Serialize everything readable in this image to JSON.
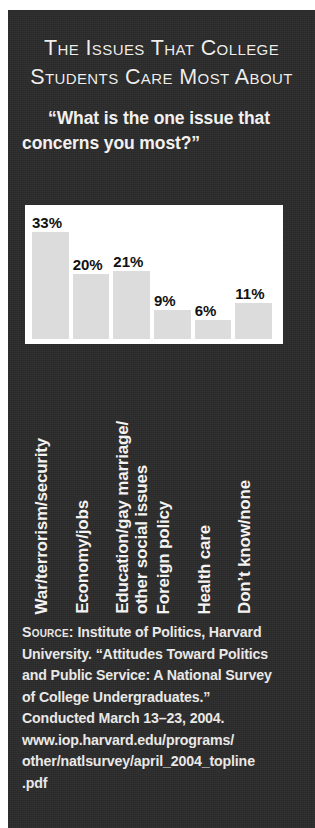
{
  "panel": {
    "background_color": "#2c2b2b",
    "text_color": "#f2f1ef"
  },
  "title": {
    "line1": "The Issues That College",
    "line2": "Students Care Most About"
  },
  "subtitle": {
    "text": "“What is the one issue that concerns you most?”"
  },
  "chart_data": {
    "type": "bar",
    "title": "The Issues That College Students Care Most About",
    "subtitle": "“What is the one issue that concerns you most?”",
    "xlabel": "",
    "ylabel": "",
    "ylim": [
      0,
      40
    ],
    "grid": false,
    "legend": "none",
    "bar_color": "#dcdcdc",
    "plot_background": "#ffffff",
    "value_suffix": "%",
    "categories": [
      "War/terrorism/security",
      "Economy/jobs",
      "Education/gay marriage/ other social issues",
      "Foreign policy",
      "Health care",
      "Don’t know/none"
    ],
    "values": [
      33,
      20,
      21,
      9,
      6,
      11
    ],
    "data_labels": [
      "33%",
      "20%",
      "21%",
      "9%",
      "6%",
      "11%"
    ]
  },
  "category_labels": [
    {
      "lines": [
        "War/terrorism/security"
      ]
    },
    {
      "lines": [
        "Economy/jobs"
      ]
    },
    {
      "lines": [
        "Education/gay marriage/",
        "other social issues"
      ]
    },
    {
      "lines": [
        "Foreign policy"
      ]
    },
    {
      "lines": [
        "Health care"
      ]
    },
    {
      "lines": [
        "Don’t know/none"
      ]
    }
  ],
  "source": {
    "label": "Source:",
    "line1": " Institute of Politics, Harvard",
    "line2": "University. “Attitudes Toward Politics",
    "line3": "and Public Service: A National Survey",
    "line4": "of College Undergraduates.”",
    "line5": "Conducted March 13–23, 2004.",
    "line6": "www.iop.harvard.edu/programs/",
    "line7": "other/natlsurvey/april_2004_topline",
    "line8": ".pdf"
  }
}
